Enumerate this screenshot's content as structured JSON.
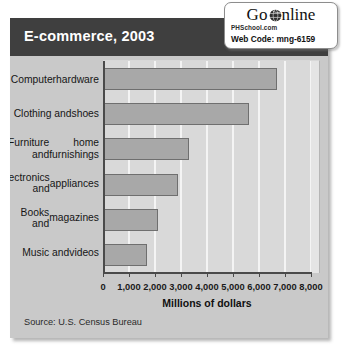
{
  "panel": {
    "title": "E-commerce, 2003",
    "source": "Source: U.S. Census Bureau"
  },
  "badge": {
    "go": "Go",
    "online": "nline",
    "globe_icon": "globe-icon",
    "site": "PHSchool.com",
    "code": "Web Code: mng-6159"
  },
  "colors": {
    "title_band": "#3f3f3f",
    "panel_bg": "#c9c9c9",
    "plot_bg": "#d9d9d9",
    "gridline": "#f4f4f4",
    "bar_fill": "#a8a8a8",
    "bar_stroke": "#6f6f6f",
    "axis": "#4a4a4a"
  },
  "chart_data": {
    "type": "bar",
    "orientation": "horizontal",
    "title": "E-commerce, 2003",
    "categories": [
      "Computer hardware",
      "Clothing and shoes",
      "Furniture and home furnishings",
      "Electronics and appliances",
      "Books and magazines",
      "Music and videos"
    ],
    "category_lines": [
      [
        "Computer",
        "hardware"
      ],
      [
        "Clothing and",
        "shoes"
      ],
      [
        "Furniture and",
        "home furnishings"
      ],
      [
        "Electronics and",
        "appliances"
      ],
      [
        "Books and",
        "magazines"
      ],
      [
        "Music and",
        "videos"
      ]
    ],
    "values": [
      6700,
      5600,
      3300,
      2900,
      2100,
      1700
    ],
    "xlabel": "Millions of dollars",
    "ylabel": "",
    "xlim": [
      0,
      8000
    ],
    "xticks": [
      0,
      1000,
      2000,
      3000,
      4000,
      5000,
      6000,
      7000,
      8000
    ],
    "xticklabels": [
      "0",
      "1,000",
      "2,000",
      "3,000",
      "4,000",
      "5,000",
      "6,000",
      "7,000",
      "8,000"
    ],
    "grid": true,
    "legend": false,
    "source": "Source: U.S. Census Bureau"
  }
}
